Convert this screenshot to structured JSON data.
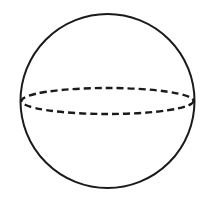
{
  "diagram": {
    "shape": "sphere",
    "background": "#ffffff",
    "stroke_color": "#1a1a1a",
    "outline": {
      "cx": 107.5,
      "cy": 101,
      "r": 87
    },
    "equator": {
      "cx": 107.5,
      "cy": 101,
      "rx": 86,
      "ry": 13,
      "style": "dashed"
    }
  }
}
